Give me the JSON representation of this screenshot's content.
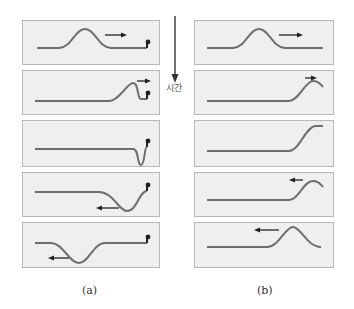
{
  "figure": {
    "time_label": "시간",
    "captions": {
      "a": "(a)",
      "b": "(b)"
    },
    "colors": {
      "rope": "#6e6e6e",
      "arrow": "#222222",
      "panel_bg": "#efefef",
      "panel_border": "#b8b8b8"
    }
  },
  "columns": {
    "a": {
      "description": "Pulse reflecting from a fixed end (inverted)",
      "panels": [
        {
          "step": 1,
          "pulse": "upright hump moving right",
          "arrow": "right",
          "end": "fixed"
        },
        {
          "step": 2,
          "pulse": "hump reaching fixed end",
          "arrow": "right",
          "end": "fixed"
        },
        {
          "step": 3,
          "pulse": "inverted dip at fixed end",
          "arrow": "none",
          "end": "fixed"
        },
        {
          "step": 4,
          "pulse": "inverted dip moving left",
          "arrow": "left",
          "end": "fixed"
        },
        {
          "step": 5,
          "pulse": "inverted pulse moving left",
          "arrow": "left",
          "end": "fixed"
        }
      ]
    },
    "b": {
      "description": "Pulse reflecting from a free end (upright)",
      "panels": [
        {
          "step": 1,
          "pulse": "upright hump moving right",
          "arrow": "right",
          "end": "free"
        },
        {
          "step": 2,
          "pulse": "hump reaching free end",
          "arrow": "right",
          "end": "free"
        },
        {
          "step": 3,
          "pulse": "end raised at maximum",
          "arrow": "none",
          "end": "free"
        },
        {
          "step": 4,
          "pulse": "upright hump moving left",
          "arrow": "left",
          "end": "free"
        },
        {
          "step": 5,
          "pulse": "upright pulse moving left",
          "arrow": "left",
          "end": "free"
        }
      ]
    }
  }
}
